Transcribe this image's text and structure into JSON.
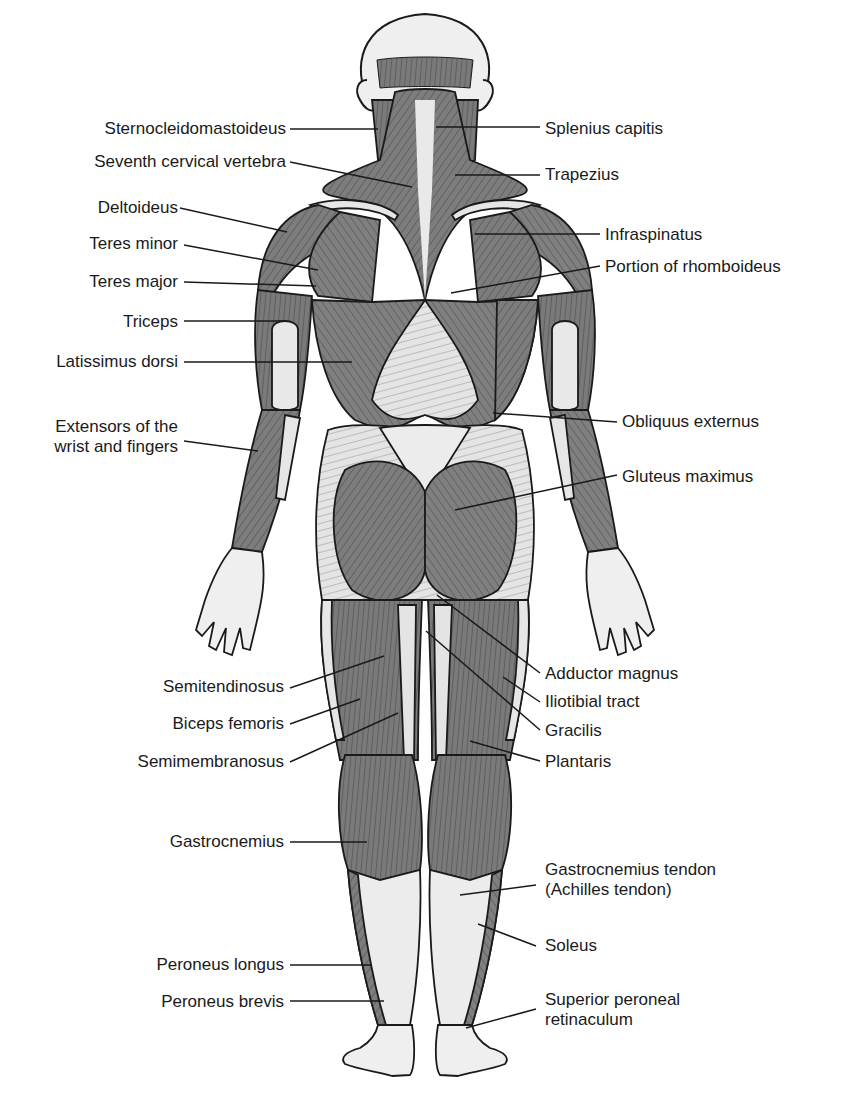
{
  "diagram": {
    "view": "posterior",
    "colors": {
      "background": "#ffffff",
      "outline": "#1a1a1a",
      "muscle_dark": "#6e6e6e",
      "muscle_mid": "#8c8c8c",
      "tendon_light": "#e6e6e6",
      "skin": "#efefef",
      "label_text": "#1a1a1a",
      "leader_line": "#1a1a1a"
    },
    "labels_left": [
      {
        "id": "sternocleidomastoideus",
        "text": "Sternocleidomastoideus",
        "x": 286,
        "y": 119,
        "line": [
          290,
          129,
          378,
          129
        ]
      },
      {
        "id": "seventh-cervical-vertebra",
        "text": "Seventh cervical vertebra",
        "x": 286,
        "y": 152,
        "line": [
          290,
          162,
          412,
          187
        ]
      },
      {
        "id": "deltoideus",
        "text": "Deltoideus",
        "x": 178,
        "y": 198,
        "line": [
          180,
          208,
          287,
          232
        ]
      },
      {
        "id": "teres-minor",
        "text": "Teres minor",
        "x": 178,
        "y": 234,
        "line": [
          184,
          245,
          318,
          270
        ]
      },
      {
        "id": "teres-major",
        "text": "Teres major",
        "x": 178,
        "y": 272,
        "line": [
          184,
          282,
          316,
          286
        ]
      },
      {
        "id": "triceps",
        "text": "Triceps",
        "x": 178,
        "y": 312,
        "line": [
          184,
          321,
          286,
          321
        ]
      },
      {
        "id": "latissimus-dorsi",
        "text": "Latissimus dorsi",
        "x": 178,
        "y": 352,
        "line": [
          184,
          362,
          352,
          362
        ]
      },
      {
        "id": "extensors-wrist-fingers",
        "lines": [
          "Extensors of the",
          "wrist and fingers"
        ],
        "x": 178,
        "y": 417,
        "line": [
          184,
          441,
          258,
          451
        ]
      },
      {
        "id": "semitendinosus",
        "text": "Semitendinosus",
        "x": 284,
        "y": 677,
        "line": [
          290,
          688,
          384,
          656
        ]
      },
      {
        "id": "biceps-femoris",
        "text": "Biceps femoris",
        "x": 284,
        "y": 714,
        "line": [
          290,
          724,
          360,
          699
        ]
      },
      {
        "id": "semimembranosus",
        "text": "Semimembranosus",
        "x": 284,
        "y": 752,
        "line": [
          290,
          762,
          398,
          713
        ]
      },
      {
        "id": "gastrocnemius",
        "text": "Gastrocnemius",
        "x": 284,
        "y": 832,
        "line": [
          290,
          842,
          367,
          842
        ]
      },
      {
        "id": "peroneus-longus",
        "text": "Peroneus longus",
        "x": 284,
        "y": 955,
        "line": [
          290,
          965,
          372,
          965
        ]
      },
      {
        "id": "peroneus-brevis",
        "text": "Peroneus brevis",
        "x": 284,
        "y": 992,
        "line": [
          290,
          1001,
          384,
          1001
        ]
      }
    ],
    "labels_right": [
      {
        "id": "splenius-capitis",
        "text": "Splenius capitis",
        "x": 545,
        "y": 119,
        "line": [
          436,
          127,
          540,
          127
        ]
      },
      {
        "id": "trapezius",
        "text": "Trapezius",
        "x": 545,
        "y": 165,
        "line": [
          455,
          175,
          540,
          175
        ]
      },
      {
        "id": "infraspinatus",
        "text": "Infraspinatus",
        "x": 605,
        "y": 225,
        "line": [
          475,
          234,
          600,
          234
        ]
      },
      {
        "id": "portion-of-rhomboideus",
        "text": "Portion of rhomboideus",
        "x": 605,
        "y": 257,
        "line": [
          451,
          293,
          600,
          266
        ]
      },
      {
        "id": "obliquus-externus",
        "text": "Obliquus externus",
        "x": 622,
        "y": 412,
        "line": [
          493,
          413,
          617,
          422
        ]
      },
      {
        "id": "gluteus-maximus",
        "text": "Gluteus maximus",
        "x": 622,
        "y": 467,
        "line": [
          455,
          510,
          617,
          475
        ]
      },
      {
        "id": "adductor-magnus",
        "text": "Adductor magnus",
        "x": 545,
        "y": 664,
        "line": [
          437,
          595,
          540,
          673
        ]
      },
      {
        "id": "iliotibial-tract",
        "text": "Iliotibial tract",
        "x": 545,
        "y": 692,
        "line": [
          503,
          677,
          540,
          702
        ]
      },
      {
        "id": "gracilis",
        "text": "Gracilis",
        "x": 545,
        "y": 721,
        "line": [
          426,
          631,
          540,
          730
        ]
      },
      {
        "id": "plantaris",
        "text": "Plantaris",
        "x": 545,
        "y": 752,
        "line": [
          470,
          741,
          540,
          761
        ]
      },
      {
        "id": "gastrocnemius-tendon",
        "lines": [
          "Gastrocnemius tendon",
          "(Achilles tendon)"
        ],
        "x": 545,
        "y": 860,
        "line": [
          460,
          895,
          536,
          885
        ]
      },
      {
        "id": "soleus",
        "text": "Soleus",
        "x": 545,
        "y": 936,
        "line": [
          478,
          924,
          536,
          946
        ]
      },
      {
        "id": "superior-peroneal-retinaculum",
        "lines": [
          "Superior peroneal",
          "retinaculum"
        ],
        "x": 545,
        "y": 990,
        "line": [
          466,
          1028,
          536,
          1009
        ]
      }
    ]
  }
}
